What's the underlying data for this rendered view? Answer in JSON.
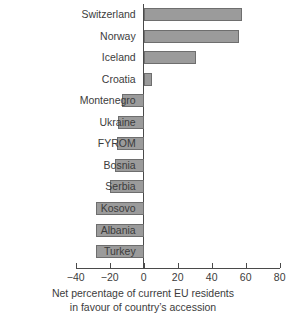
{
  "chart_data": {
    "type": "bar",
    "orientation": "horizontal",
    "title": "",
    "subtitle": "",
    "xlabel": "Net percentage of current EU residents in favour of country's accession",
    "xlabel_line1": "Net percentage of current EU residents",
    "xlabel_line2": "in favour of country’s accession",
    "ylabel": "",
    "categories": [
      "Switzerland",
      "Norway",
      "Iceland",
      "Croatia",
      "Montenegro",
      "Ukraine",
      "FYROM",
      "Bosnia",
      "Serbia",
      "Kosovo",
      "Albania",
      "Turkey"
    ],
    "values": [
      58,
      56,
      31,
      5,
      -13,
      -15,
      -16,
      -17,
      -20,
      -28,
      -28,
      -28
    ],
    "xlim": [
      -40,
      80
    ],
    "xticks": [
      -40,
      -20,
      0,
      20,
      40,
      60,
      80
    ],
    "xtick_labels": [
      "−40",
      "−20",
      "0",
      "20",
      "40",
      "60",
      "80"
    ],
    "grid": false,
    "legend": false,
    "bar_color": "#9b9b9b",
    "bar_border_color": "#6e6e6e",
    "axis_color": "#4a4a4a",
    "text_color": "#3c3c3c",
    "background": "#ffffff"
  }
}
